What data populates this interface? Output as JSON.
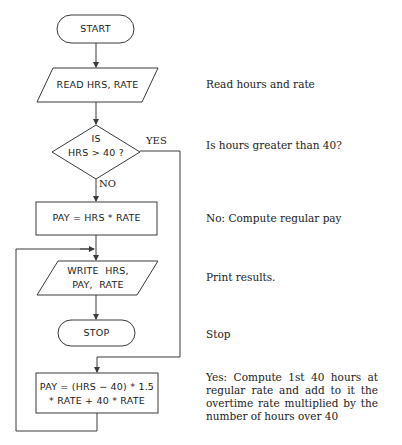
{
  "flowchart": {
    "start": {
      "label": "START"
    },
    "read": {
      "label": "READ HRS, RATE"
    },
    "decision": {
      "line1": "IS",
      "line2": "HRS > 40 ?"
    },
    "yes_label": "YES",
    "no_label": "NO",
    "regular_pay": {
      "label": "PAY = HRS * RATE"
    },
    "write": {
      "line1": "WRITE  HRS,",
      "line2": "PAY,  RATE"
    },
    "stop": {
      "label": "STOP"
    },
    "overtime_pay": {
      "line1": "PAY = (HRS − 40) * 1.5",
      "line2": "* RATE + 40 * RATE"
    }
  },
  "annotations": {
    "read": "Read hours and rate",
    "decision": "Is hours greater than 40?",
    "regular_pay": "No: Compute regular pay",
    "write": "Print results.",
    "stop": "Stop",
    "overtime_pay": "Yes: Compute 1st 40 hours at regular rate and add to it the overtime rate multiplied by the number of hours over 40"
  },
  "colors": {
    "line": "#3a3a3a",
    "text": "#222222",
    "background": "#ffffff"
  }
}
